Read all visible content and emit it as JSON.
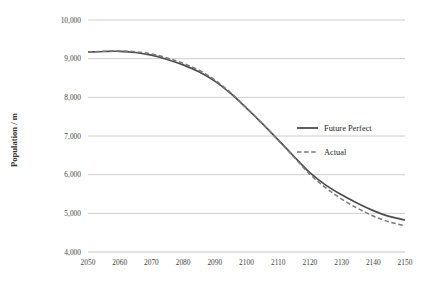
{
  "chart_data": {
    "type": "line",
    "title": "",
    "xlabel": "",
    "ylabel": "Population / m",
    "xlim": [
      2050,
      2150
    ],
    "ylim": [
      4000,
      10000
    ],
    "grid": "horizontal",
    "legend_position": "center-right",
    "x": [
      2050,
      2055,
      2060,
      2065,
      2070,
      2075,
      2080,
      2085,
      2090,
      2095,
      2100,
      2105,
      2110,
      2115,
      2120,
      2125,
      2130,
      2135,
      2140,
      2145,
      2150
    ],
    "x_tick_labels": [
      "2050",
      "2060",
      "2070",
      "2080",
      "2090",
      "2100",
      "2110",
      "2120",
      "2130",
      "2140",
      "2150"
    ],
    "x_ticks": [
      2050,
      2060,
      2070,
      2080,
      2090,
      2100,
      2110,
      2120,
      2130,
      2140,
      2150
    ],
    "y_tick_labels": [
      "10,000",
      "9,000",
      "8,000",
      "7,000",
      "6,000",
      "5,000",
      "4,000"
    ],
    "y_ticks": [
      10000,
      9000,
      8000,
      7000,
      6000,
      5000,
      4000
    ],
    "series": [
      {
        "name": "Future Perfect",
        "style": "solid",
        "color": "#4d4d4d",
        "values": [
          9170,
          9185,
          9190,
          9160,
          9090,
          8980,
          8840,
          8660,
          8420,
          8100,
          7720,
          7320,
          6900,
          6470,
          6050,
          5730,
          5480,
          5260,
          5070,
          4920,
          4830
        ]
      },
      {
        "name": "Actual",
        "style": "dashed",
        "color": "#7a7a7a",
        "values": [
          9170,
          9190,
          9200,
          9180,
          9120,
          9020,
          8880,
          8700,
          8450,
          8120,
          7730,
          7320,
          6890,
          6450,
          6010,
          5660,
          5370,
          5130,
          4930,
          4780,
          4680
        ]
      }
    ]
  },
  "legend": {
    "items": [
      {
        "label": "Future Perfect",
        "swatch": "solid-line-swatch"
      },
      {
        "label": "Actual",
        "swatch": "dashed-line-swatch"
      }
    ]
  },
  "axes": {
    "y_title": "Population / m"
  }
}
